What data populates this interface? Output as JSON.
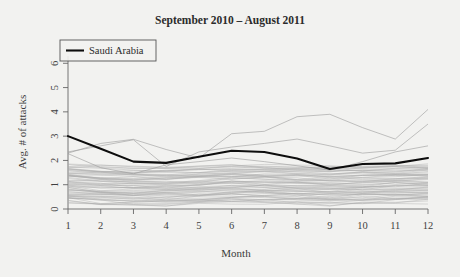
{
  "chart_data": {
    "type": "line",
    "title": "September 2010 – August 2011",
    "xlabel": "Month",
    "ylabel": "Avg. # of attacks",
    "x": [
      1,
      2,
      3,
      4,
      5,
      6,
      7,
      8,
      9,
      10,
      11,
      12
    ],
    "xticklabels": [
      "1",
      "2",
      "3",
      "4",
      "5",
      "6",
      "7",
      "8",
      "9",
      "10",
      "11",
      "12"
    ],
    "yticks": [
      0,
      1,
      2,
      3,
      4,
      5,
      6
    ],
    "yticklabels": [
      "0",
      "1",
      "2",
      "3",
      "4",
      "5",
      "6"
    ],
    "xlim": [
      1,
      12
    ],
    "ylim": [
      0,
      6.3
    ],
    "grid": false,
    "legend": {
      "position": "top-left",
      "entries": [
        {
          "label": "Saudi Arabia",
          "color": "#0d0d0d",
          "style": "bold-line"
        }
      ]
    },
    "series": [
      {
        "name": "Saudi Arabia",
        "highlight": true,
        "color": "#0d0d0d",
        "values": [
          3.0,
          2.48,
          1.95,
          1.9,
          2.15,
          2.4,
          2.35,
          2.08,
          1.65,
          1.85,
          1.88,
          2.1
        ]
      },
      {
        "name": "outlier-a",
        "highlight": false,
        "color": "#9a9a9a",
        "values": [
          2.3,
          2.7,
          2.87,
          2.45,
          2.1,
          3.1,
          3.2,
          3.8,
          3.9,
          3.35,
          2.88,
          4.1
        ]
      },
      {
        "name": "outlier-b",
        "highlight": false,
        "color": "#9a9a9a",
        "values": [
          2.35,
          2.6,
          2.85,
          1.75,
          2.35,
          2.55,
          2.7,
          2.88,
          2.6,
          2.3,
          2.42,
          3.5
        ]
      },
      {
        "name": "outlier-c",
        "highlight": false,
        "color": "#9a9a9a",
        "values": [
          2.28,
          1.7,
          1.45,
          1.82,
          1.95,
          2.1,
          1.95,
          1.78,
          1.6,
          1.95,
          2.35,
          2.6
        ]
      },
      {
        "name": "band-lines",
        "highlight": false,
        "color": "#a9a9a9",
        "note": "dense bundle of country series spanning approx. 0.2 to 1.8 attacks"
      }
    ],
    "band": {
      "count": 60,
      "low": 0.22,
      "high": 1.78
    }
  }
}
